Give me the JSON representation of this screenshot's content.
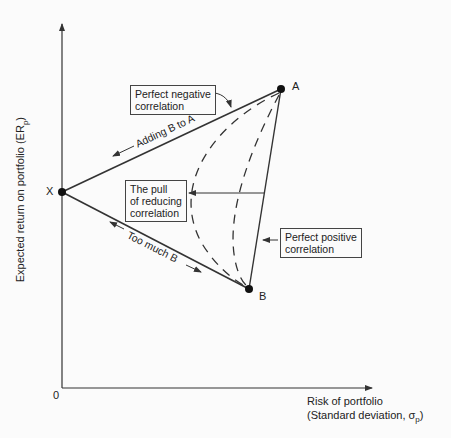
{
  "axes": {
    "y_label": "Expected return on portfolio (ER",
    "y_label_sub": "p",
    "y_label_end": ")",
    "x_label_line1": "Risk of portfolio",
    "x_label_line2": "(Standard deviation, σ",
    "x_label_sub": "p",
    "x_label_end": ")",
    "origin": "0"
  },
  "points": {
    "x": "X",
    "a": "A",
    "b": "B"
  },
  "annotations": {
    "perfect_negative_1": "Perfect negative",
    "perfect_negative_2": "correlation",
    "pull_1": "The pull",
    "pull_2": "of reducing",
    "pull_3": "correlation",
    "perfect_positive_1": "Perfect positive",
    "perfect_positive_2": "correlation",
    "adding_b_to_a": "Adding B to A",
    "too_much_b": "Too much B"
  },
  "colors": {
    "line": "#333333",
    "background": "#fbfbfb"
  }
}
